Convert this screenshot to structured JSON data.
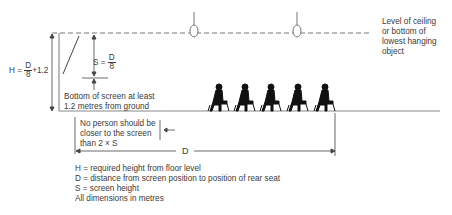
{
  "diagram": {
    "ceiling_label": [
      "Level of ceiling",
      "or bottom of",
      "lowest hanging",
      "object"
    ],
    "height_formula": {
      "lhs": "H =",
      "num": "D",
      "den": "8",
      "rhs": "+1.2"
    },
    "screen_formula": {
      "lhs": "S =",
      "num": "D",
      "den": "8"
    },
    "screen_bottom_note": [
      "Bottom of screen at least",
      "1.2 metres from ground"
    ],
    "min_distance_note": [
      "No person should be",
      "closer to the screen",
      "than 2 × S"
    ],
    "distance_label": "D",
    "legend": [
      "H = required height from floor level",
      "D = distance from screen position to position of rear seat",
      "S = screen height",
      "All dimensions in metres"
    ],
    "seated_people_count": 5,
    "hanging_lights_count": 2,
    "colors": {
      "line": "#555555",
      "dashed": "#777777",
      "silhouette": "#111111",
      "text": "#3a3a3a"
    }
  }
}
